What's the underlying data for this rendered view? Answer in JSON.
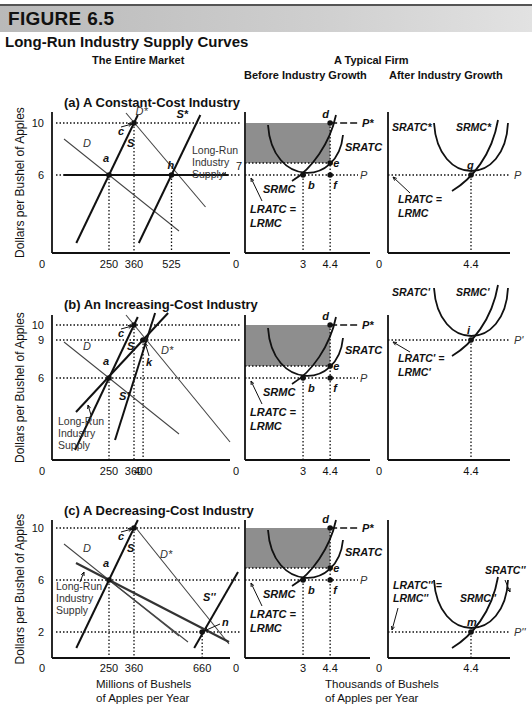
{
  "figure_label": "FIGURE 6.5",
  "title": "Long-Run Industry Supply Curves",
  "column_headers": {
    "market": "The Entire Market",
    "firm": "A Typical Firm",
    "before": "Before Industry Growth",
    "after": "After Industry Growth"
  },
  "ylabel": "Dollars per Bushel of Apples",
  "market_xlabel": [
    "Millions of Bushels",
    "of Apples per Year"
  ],
  "firm_xlabel": [
    "Thousands of Bushels",
    "of Apples per Year"
  ],
  "chart_data": [
    {
      "type": "line",
      "panel": "a",
      "title": "(a) A Constant-Cost Industry",
      "market": {
        "yticks": [
          "10",
          "6"
        ],
        "xticks": [
          "0",
          "250",
          "360",
          "525"
        ],
        "points": [
          {
            "label": "a",
            "x": 250,
            "y": 6
          },
          {
            "label": "c",
            "x": 360,
            "y": 10
          },
          {
            "label": "h",
            "x": 525,
            "y": 6
          }
        ],
        "curves": [
          "D",
          "S",
          "D*",
          "S*",
          "Long-Run Industry Supply"
        ],
        "annotation": "7"
      },
      "firm_before": {
        "xticks": [
          "0",
          "3",
          "4.4"
        ],
        "price_labels": [
          "P*",
          "P"
        ],
        "points": [
          {
            "label": "d",
            "x": 4.4,
            "y": 10
          },
          {
            "label": "e",
            "x": 4.4,
            "y": 7
          },
          {
            "label": "b",
            "x": 3,
            "y": 6
          },
          {
            "label": "f",
            "x": 4.4,
            "y": 6
          }
        ],
        "curves": [
          "SRATC",
          "SRMC",
          "LRATC = LRMC"
        ]
      },
      "firm_after": {
        "xticks": [
          "0",
          "4.4"
        ],
        "price_label": "P",
        "points": [
          {
            "label": "g",
            "x": 4.4,
            "y": 6
          }
        ],
        "curves": [
          "SRATC*",
          "SRMC*",
          "LRATC = LRMC"
        ]
      }
    },
    {
      "type": "line",
      "panel": "b",
      "title": "(b) An Increasing-Cost Industry",
      "market": {
        "yticks": [
          "10",
          "9",
          "6"
        ],
        "xticks": [
          "0",
          "250",
          "360",
          "400"
        ],
        "points": [
          {
            "label": "a",
            "x": 250,
            "y": 6
          },
          {
            "label": "c",
            "x": 360,
            "y": 10
          },
          {
            "label": "k",
            "x": 400,
            "y": 9
          }
        ],
        "curves": [
          "D",
          "S",
          "D*",
          "S'",
          "Long-Run Industry Supply"
        ]
      },
      "firm_before": {
        "xticks": [
          "0",
          "3",
          "4.4"
        ],
        "price_labels": [
          "P*",
          "P"
        ],
        "points": [
          {
            "label": "d",
            "x": 4.4,
            "y": 10
          },
          {
            "label": "e",
            "x": 4.4,
            "y": 7
          },
          {
            "label": "b",
            "x": 3,
            "y": 6
          },
          {
            "label": "f",
            "x": 4.4,
            "y": 6
          }
        ],
        "curves": [
          "SRATC",
          "SRMC",
          "LRATC = LRMC"
        ]
      },
      "firm_after": {
        "xticks": [
          "0",
          "4.4"
        ],
        "price_label": "P'",
        "points": [
          {
            "label": "i",
            "x": 4.4,
            "y": 9
          }
        ],
        "curves": [
          "SRATC'",
          "SRMC'",
          "LRATC' = LRMC'"
        ]
      }
    },
    {
      "type": "line",
      "panel": "c",
      "title": "(c) A Decreasing-Cost Industry",
      "market": {
        "yticks": [
          "10",
          "6",
          "2"
        ],
        "xticks": [
          "0",
          "250",
          "360",
          "660"
        ],
        "points": [
          {
            "label": "a",
            "x": 250,
            "y": 6
          },
          {
            "label": "c",
            "x": 360,
            "y": 10
          },
          {
            "label": "n",
            "x": 660,
            "y": 2
          }
        ],
        "curves": [
          "D",
          "S",
          "D*",
          "S''",
          "Long-Run Industry Supply"
        ]
      },
      "firm_before": {
        "xticks": [
          "0",
          "3",
          "4.4"
        ],
        "price_labels": [
          "P*",
          "P"
        ],
        "points": [
          {
            "label": "d",
            "x": 4.4,
            "y": 10
          },
          {
            "label": "e",
            "x": 4.4,
            "y": 7
          },
          {
            "label": "b",
            "x": 3,
            "y": 6
          },
          {
            "label": "f",
            "x": 4.4,
            "y": 6
          }
        ],
        "curves": [
          "SRATC",
          "SRMC",
          "LRATC = LRMC"
        ]
      },
      "firm_after": {
        "xticks": [
          "0",
          "4.4"
        ],
        "price_label": "P''",
        "points": [
          {
            "label": "m",
            "x": 4.4,
            "y": 2
          }
        ],
        "curves": [
          "SRATC''",
          "SRMC''",
          "LRATC'' = LRMC''"
        ]
      }
    }
  ],
  "colors": {
    "header_bar": "#c4c4c4",
    "shaded_profit": "#7a7a7a",
    "ink": "#111111",
    "thin_line": "#555555"
  }
}
